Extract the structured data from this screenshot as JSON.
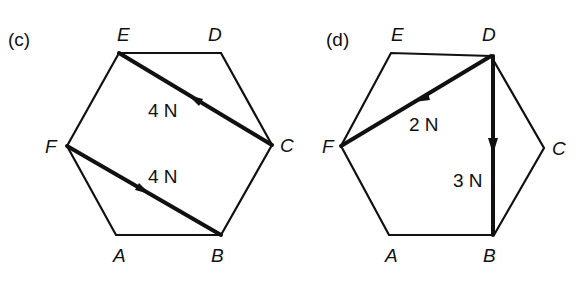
{
  "figures": [
    {
      "id": "c",
      "panel_label": "(c)",
      "vertices": {
        "A": {
          "label": "A",
          "x": 116,
          "y": 235
        },
        "B": {
          "label": "B",
          "x": 221,
          "y": 235
        },
        "C": {
          "label": "C",
          "x": 272,
          "y": 145
        },
        "D": {
          "label": "D",
          "x": 221,
          "y": 53
        },
        "E": {
          "label": "E",
          "x": 119,
          "y": 53
        },
        "F": {
          "label": "F",
          "x": 67,
          "y": 146
        }
      },
      "forces": [
        {
          "from": "C",
          "to": "E",
          "magnitude": "4 N"
        },
        {
          "from": "F",
          "to": "B",
          "magnitude": "4 N"
        }
      ]
    },
    {
      "id": "d",
      "panel_label": "(d)",
      "vertices": {
        "A": {
          "label": "A",
          "x": 389,
          "y": 235
        },
        "B": {
          "label": "B",
          "x": 494,
          "y": 235
        },
        "C": {
          "label": "C",
          "x": 544,
          "y": 148
        },
        "D": {
          "label": "D",
          "x": 491,
          "y": 56
        },
        "E": {
          "label": "E",
          "x": 391,
          "y": 53
        },
        "F": {
          "label": "F",
          "x": 341,
          "y": 146
        }
      },
      "forces": [
        {
          "from": "D",
          "to": "F",
          "magnitude": "2 N"
        },
        {
          "from": "D",
          "to": "B",
          "magnitude": "3 N"
        }
      ]
    }
  ],
  "colors": {
    "stroke": "#111111",
    "background": "#ffffff"
  }
}
